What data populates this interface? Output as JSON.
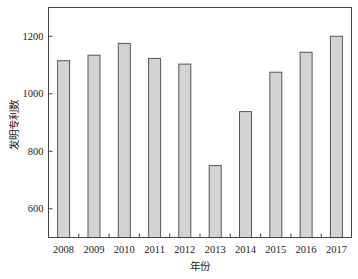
{
  "chart_data": {
    "type": "bar",
    "title": "",
    "xlabel": "年份",
    "ylabel": "发明专利数",
    "categories": [
      "2008",
      "2009",
      "2010",
      "2011",
      "2012",
      "2013",
      "2014",
      "2015",
      "2016",
      "2017"
    ],
    "values": [
      1115,
      1134,
      1175,
      1123,
      1103,
      750,
      938,
      1075,
      1144,
      1200
    ],
    "ylim": [
      500,
      1300
    ],
    "yticks": [
      600,
      800,
      1000,
      1200
    ],
    "grid": false,
    "legend": "none",
    "colors": {
      "bar_fill": "#d4d4d4",
      "bar_edge": "#555555",
      "axis": "#444444"
    }
  }
}
